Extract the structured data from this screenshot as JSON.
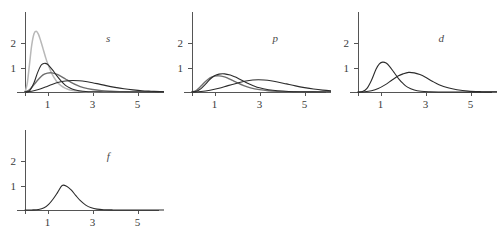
{
  "figure": {
    "title": "",
    "background_color": "#ffffff",
    "axis_color": "#555555",
    "curve_colors": {
      "dark": "#2b2b2b",
      "mid": "#6e6e6e",
      "light": "#b8b8b8"
    }
  },
  "chart_data": {
    "type": "line",
    "title": "",
    "xlabel": "",
    "ylabel": "",
    "xlim": [
      0,
      6.6
    ],
    "ylim": [
      0,
      2.6
    ],
    "grid": false,
    "legend_position": "none",
    "xticks": [
      1,
      3,
      5
    ],
    "xtick_labels": [
      "1",
      "3",
      "5"
    ],
    "yticks": [
      1,
      2
    ],
    "ytick_labels": [
      "1",
      "2"
    ],
    "panels": [
      {
        "label": "s",
        "label_x": 3.7,
        "label_y": 2.05,
        "series": [
          {
            "name": "1s",
            "color": "light",
            "peak_x": 0.53,
            "peak_y": 2.48,
            "width": 0.22,
            "x": [
              0.0,
              0.1,
              0.2,
              0.3,
              0.4,
              0.5,
              0.6,
              0.7,
              0.8,
              0.9,
              1.0,
              1.2,
              1.4,
              1.6,
              1.8,
              2.0,
              2.4,
              2.8,
              3.2,
              3.6,
              4.0,
              4.6,
              5.2,
              6.0,
              6.6
            ],
            "y": [
              0.0,
              0.35,
              1.13,
              1.92,
              2.38,
              2.48,
              2.35,
              2.08,
              1.77,
              1.46,
              1.18,
              0.74,
              0.44,
              0.26,
              0.15,
              0.085,
              0.026,
              0.008,
              0.002,
              0.001,
              0.0,
              0.0,
              0.0,
              0.0,
              0.0
            ]
          },
          {
            "name": "2s",
            "color": "mid",
            "peak_x": 1.25,
            "peak_y": 0.78,
            "width": 0.55,
            "x": [
              0.0,
              0.2,
              0.4,
              0.6,
              0.8,
              1.0,
              1.2,
              1.4,
              1.6,
              1.8,
              2.0,
              2.3,
              2.6,
              3.0,
              3.4,
              3.8,
              4.2,
              4.8,
              5.4,
              6.0,
              6.6
            ],
            "y": [
              0.0,
              0.09,
              0.3,
              0.52,
              0.7,
              0.77,
              0.78,
              0.73,
              0.64,
              0.53,
              0.42,
              0.28,
              0.18,
              0.1,
              0.055,
              0.03,
              0.015,
              0.005,
              0.002,
              0.0,
              0.0
            ]
          },
          {
            "name": "3s",
            "color": "dark",
            "peak_x": 0.9,
            "peak_y": 1.17,
            "width": 0.33,
            "x": [
              0.0,
              0.2,
              0.4,
              0.55,
              0.7,
              0.8,
              0.9,
              1.0,
              1.1,
              1.25,
              1.4,
              1.6,
              1.8,
              2.0,
              2.2,
              2.4,
              2.7,
              3.0,
              3.5,
              4.0,
              4.6,
              5.2,
              6.0,
              6.6
            ],
            "y": [
              0.0,
              0.05,
              0.38,
              0.77,
              1.07,
              1.15,
              1.17,
              1.13,
              1.04,
              0.87,
              0.68,
              0.45,
              0.27,
              0.16,
              0.09,
              0.05,
              0.02,
              0.01,
              0.003,
              0.001,
              0.0,
              0.0,
              0.0,
              0.0
            ]
          },
          {
            "name": "4s",
            "color": "dark",
            "peak_x": 2.1,
            "peak_y": 0.47,
            "width": 0.95,
            "x": [
              0.0,
              0.3,
              0.6,
              0.9,
              1.2,
              1.5,
              1.8,
              2.1,
              2.4,
              2.7,
              3.0,
              3.3,
              3.6,
              4.0,
              4.4,
              4.8,
              5.2,
              5.6,
              6.0,
              6.3,
              6.6
            ],
            "y": [
              0.0,
              0.03,
              0.1,
              0.2,
              0.31,
              0.4,
              0.45,
              0.47,
              0.46,
              0.43,
              0.38,
              0.32,
              0.26,
              0.19,
              0.13,
              0.085,
              0.05,
              0.03,
              0.015,
              0.008,
              0.004
            ]
          }
        ]
      },
      {
        "label": "p",
        "label_x": 3.7,
        "label_y": 2.05,
        "series": [
          {
            "name": "2p",
            "color": "mid",
            "peak_x": 1.25,
            "peak_y": 0.66,
            "width": 0.62,
            "x": [
              0.0,
              0.2,
              0.4,
              0.6,
              0.8,
              1.0,
              1.2,
              1.4,
              1.6,
              1.8,
              2.0,
              2.3,
              2.6,
              3.0,
              3.4,
              3.8,
              4.2,
              4.8,
              5.4,
              6.0,
              6.6
            ],
            "y": [
              0.0,
              0.07,
              0.24,
              0.43,
              0.58,
              0.65,
              0.66,
              0.63,
              0.56,
              0.47,
              0.38,
              0.26,
              0.17,
              0.095,
              0.05,
              0.027,
              0.014,
              0.005,
              0.002,
              0.001,
              0.0
            ]
          },
          {
            "name": "3p",
            "color": "dark",
            "peak_x": 1.45,
            "peak_y": 0.74,
            "width": 0.6,
            "x": [
              0.0,
              0.2,
              0.4,
              0.6,
              0.8,
              1.0,
              1.2,
              1.45,
              1.7,
              1.9,
              2.1,
              2.4,
              2.7,
              3.0,
              3.4,
              3.8,
              4.3,
              4.8,
              5.4,
              6.0,
              6.6
            ],
            "y": [
              0.0,
              0.03,
              0.14,
              0.32,
              0.52,
              0.66,
              0.73,
              0.74,
              0.69,
              0.62,
              0.53,
              0.39,
              0.27,
              0.17,
              0.095,
              0.05,
              0.022,
              0.01,
              0.004,
              0.001,
              0.0
            ]
          },
          {
            "name": "4p",
            "color": "dark",
            "peak_x": 2.95,
            "peak_y": 0.5,
            "width": 1.15,
            "x": [
              0.0,
              0.4,
              0.8,
              1.2,
              1.6,
              2.0,
              2.4,
              2.7,
              2.95,
              3.2,
              3.5,
              3.8,
              4.2,
              4.6,
              5.0,
              5.4,
              5.8,
              6.2,
              6.6
            ],
            "y": [
              0.0,
              0.02,
              0.07,
              0.15,
              0.26,
              0.36,
              0.45,
              0.49,
              0.5,
              0.49,
              0.46,
              0.41,
              0.33,
              0.25,
              0.18,
              0.12,
              0.075,
              0.045,
              0.025
            ]
          }
        ]
      },
      {
        "label": "d",
        "label_x": 3.7,
        "label_y": 2.05,
        "series": [
          {
            "name": "3d",
            "color": "dark",
            "peak_x": 1.1,
            "peak_y": 1.22,
            "width": 0.42,
            "x": [
              0.0,
              0.2,
              0.4,
              0.6,
              0.8,
              0.95,
              1.1,
              1.25,
              1.4,
              1.6,
              1.8,
              2.0,
              2.2,
              2.5,
              2.8,
              3.2,
              3.6,
              4.2,
              5.0,
              5.8,
              6.6
            ],
            "y": [
              0.0,
              0.02,
              0.15,
              0.48,
              0.93,
              1.15,
              1.22,
              1.18,
              1.05,
              0.8,
              0.55,
              0.35,
              0.2,
              0.08,
              0.03,
              0.01,
              0.003,
              0.001,
              0.0,
              0.0,
              0.0
            ]
          },
          {
            "name": "4d",
            "color": "dark",
            "peak_x": 2.25,
            "peak_y": 0.8,
            "width": 0.7,
            "x": [
              0.0,
              0.3,
              0.6,
              0.9,
              1.2,
              1.5,
              1.8,
              2.0,
              2.25,
              2.5,
              2.75,
              3.0,
              3.3,
              3.6,
              4.0,
              4.4,
              4.9,
              5.5,
              6.0,
              6.6
            ],
            "y": [
              0.0,
              0.01,
              0.05,
              0.14,
              0.29,
              0.48,
              0.66,
              0.74,
              0.8,
              0.78,
              0.71,
              0.6,
              0.44,
              0.3,
              0.17,
              0.09,
              0.035,
              0.012,
              0.005,
              0.001
            ]
          }
        ]
      },
      {
        "label": "f",
        "label_x": 3.7,
        "label_y": 2.05,
        "series": [
          {
            "name": "4f",
            "color": "dark",
            "peak_x": 1.65,
            "peak_y": 1.0,
            "width": 0.48,
            "x": [
              0.0,
              0.3,
              0.6,
              0.85,
              1.05,
              1.25,
              1.45,
              1.65,
              1.85,
              2.05,
              2.25,
              2.45,
              2.7,
              2.95,
              3.2,
              3.5,
              3.9,
              4.4,
              5.0,
              5.8,
              6.6
            ],
            "y": [
              0.0,
              0.002,
              0.02,
              0.09,
              0.23,
              0.45,
              0.72,
              1.0,
              0.97,
              0.82,
              0.6,
              0.39,
              0.2,
              0.09,
              0.035,
              0.012,
              0.003,
              0.001,
              0.0,
              0.0,
              0.0
            ]
          }
        ]
      }
    ]
  }
}
